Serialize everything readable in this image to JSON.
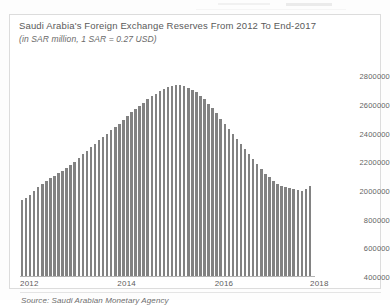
{
  "chart_data": {
    "type": "bar",
    "title": "Saudi Arabia's Foreign Exchange Reserves From 2012 To End-2017",
    "subtitle": "(in SAR million, 1 SAR = 0.27 USD)",
    "source": "Source: Saudi Arabian Monetary Agency",
    "xlabel": "",
    "ylabel": "",
    "grid": false,
    "legend": null,
    "ylim": [
      1400000,
      2900000
    ],
    "ytick_labels": [
      "2800000",
      "2600000",
      "2400000",
      "2200000",
      "2000000",
      "800000",
      "600000",
      "400000"
    ],
    "ytick_values": [
      2800000,
      2600000,
      2400000,
      2200000,
      2000000,
      1800000,
      1600000,
      1400000
    ],
    "xtick_labels": [
      "2012",
      "2014",
      "2016",
      "2018"
    ],
    "xtick_values": [
      2012,
      2014,
      2016,
      2018
    ],
    "bar_color": "#828282",
    "x": [
      "2012-01",
      "2012-02",
      "2012-03",
      "2012-04",
      "2012-05",
      "2012-06",
      "2012-07",
      "2012-08",
      "2012-09",
      "2012-10",
      "2012-11",
      "2012-12",
      "2013-01",
      "2013-02",
      "2013-03",
      "2013-04",
      "2013-05",
      "2013-06",
      "2013-07",
      "2013-08",
      "2013-09",
      "2013-10",
      "2013-11",
      "2013-12",
      "2014-01",
      "2014-02",
      "2014-03",
      "2014-04",
      "2014-05",
      "2014-06",
      "2014-07",
      "2014-08",
      "2014-09",
      "2014-10",
      "2014-11",
      "2014-12",
      "2015-01",
      "2015-02",
      "2015-03",
      "2015-04",
      "2015-05",
      "2015-06",
      "2015-07",
      "2015-08",
      "2015-09",
      "2015-10",
      "2015-11",
      "2015-12",
      "2016-01",
      "2016-02",
      "2016-03",
      "2016-04",
      "2016-05",
      "2016-06",
      "2016-07",
      "2016-08",
      "2016-09",
      "2016-10",
      "2016-11",
      "2016-12",
      "2017-01",
      "2017-02",
      "2017-03",
      "2017-04",
      "2017-05",
      "2017-06",
      "2017-07",
      "2017-08",
      "2017-09",
      "2017-10",
      "2017-11",
      "2017-12"
    ],
    "values": [
      1935000,
      1952000,
      1975000,
      2000000,
      2025000,
      2048000,
      2070000,
      2090000,
      2108000,
      2125000,
      2142000,
      2158000,
      2180000,
      2205000,
      2232000,
      2258000,
      2282000,
      2305000,
      2330000,
      2355000,
      2378000,
      2400000,
      2425000,
      2448000,
      2470000,
      2495000,
      2520000,
      2548000,
      2572000,
      2595000,
      2615000,
      2640000,
      2662000,
      2680000,
      2698000,
      2712000,
      2725000,
      2735000,
      2740000,
      2742000,
      2735000,
      2722000,
      2705000,
      2688000,
      2665000,
      2640000,
      2610000,
      2578000,
      2545000,
      2505000,
      2465000,
      2430000,
      2398000,
      2365000,
      2330000,
      2295000,
      2258000,
      2222000,
      2188000,
      2155000,
      2122000,
      2095000,
      2072000,
      2052000,
      2038000,
      2028000,
      2022000,
      2015000,
      2008000,
      2002000,
      2012000,
      2035000
    ]
  }
}
